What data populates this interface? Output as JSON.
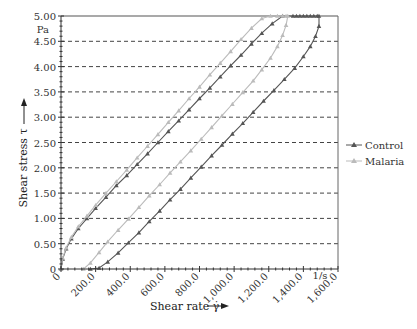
{
  "chart_data": {
    "type": "line",
    "title": "",
    "xlabel": "Shear rate γ̇",
    "ylabel": "Shear stress τ",
    "x_unit": "1/s",
    "y_unit": "Pa",
    "xlim": [
      0,
      1600
    ],
    "ylim": [
      0,
      5
    ],
    "x_ticks": [
      "0",
      "200.0",
      "400.0",
      "600.0",
      "800.0",
      "1,000.0",
      "1,200.0",
      "1,400.0",
      "1,600.0"
    ],
    "x_tick_values": [
      0,
      200,
      400,
      600,
      800,
      1000,
      1200,
      1400,
      1600
    ],
    "y_ticks": [
      "0",
      "0.50",
      "1.00",
      "1.50",
      "2.00",
      "2.50",
      "3.00",
      "3.50",
      "4.00",
      "4.50",
      "5.00"
    ],
    "y_tick_values": [
      0,
      0.5,
      1.0,
      1.5,
      2.0,
      2.5,
      3.0,
      3.5,
      4.0,
      4.5,
      5.0
    ],
    "grid": "horizontal-dashed",
    "legend": "right",
    "series": [
      {
        "name": "Control",
        "color": "#555555",
        "marker": "triangle",
        "x": [
          0,
          10,
          30,
          60,
          100,
          150,
          200,
          260,
          320,
          380,
          440,
          500,
          560,
          620,
          680,
          740,
          800,
          860,
          920,
          980,
          1040,
          1100,
          1160,
          1220,
          1280,
          1340,
          1360,
          1380,
          1400,
          1420,
          1440,
          1460,
          1480,
          1490,
          1490,
          1470,
          1440,
          1400,
          1350,
          1290,
          1230,
          1170,
          1110,
          1050,
          990,
          930,
          870,
          810,
          750,
          690,
          630,
          570,
          510,
          450,
          390,
          330,
          270,
          220,
          170
        ],
        "y": [
          0,
          0.2,
          0.4,
          0.6,
          0.8,
          1.0,
          1.2,
          1.42,
          1.65,
          1.85,
          2.07,
          2.28,
          2.5,
          2.72,
          2.93,
          3.15,
          3.37,
          3.58,
          3.8,
          4.02,
          4.23,
          4.45,
          4.66,
          4.85,
          5.0,
          5.0,
          5.0,
          5.0,
          5.0,
          5.0,
          5.0,
          5.0,
          5.0,
          5.0,
          4.8,
          4.6,
          4.4,
          4.2,
          3.97,
          3.75,
          3.53,
          3.32,
          3.1,
          2.88,
          2.67,
          2.45,
          2.24,
          2.02,
          1.8,
          1.58,
          1.37,
          1.15,
          0.94,
          0.72,
          0.52,
          0.32,
          0.14,
          0.02,
          0
        ]
      },
      {
        "name": "Malaria",
        "color": "#bbbbbb",
        "marker": "triangle",
        "x": [
          0,
          10,
          30,
          60,
          100,
          150,
          200,
          260,
          320,
          380,
          440,
          500,
          560,
          620,
          680,
          740,
          800,
          860,
          920,
          980,
          1040,
          1100,
          1160,
          1210,
          1250,
          1280,
          1300,
          1310,
          1300,
          1280,
          1250,
          1210,
          1160,
          1110,
          1050,
          990,
          930,
          870,
          810,
          750,
          690,
          630,
          570,
          510,
          450,
          390,
          330,
          270,
          220,
          170,
          130
        ],
        "y": [
          0,
          0.22,
          0.42,
          0.63,
          0.84,
          1.05,
          1.26,
          1.5,
          1.73,
          1.96,
          2.2,
          2.43,
          2.66,
          2.9,
          3.13,
          3.37,
          3.6,
          3.84,
          4.07,
          4.3,
          4.54,
          4.76,
          4.95,
          5.0,
          5.0,
          5.0,
          5.0,
          5.0,
          4.82,
          4.62,
          4.4,
          4.17,
          3.94,
          3.72,
          3.49,
          3.26,
          3.03,
          2.8,
          2.57,
          2.34,
          2.12,
          1.9,
          1.67,
          1.45,
          1.22,
          0.99,
          0.77,
          0.54,
          0.33,
          0.12,
          0
        ]
      }
    ]
  }
}
